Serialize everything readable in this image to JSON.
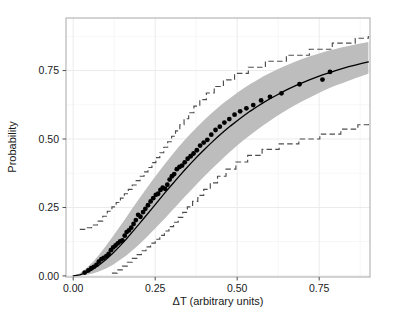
{
  "chart_data": {
    "type": "line",
    "title": "",
    "subtitle": "",
    "xlabel": "ΔT (arbitrary units)",
    "ylabel": "Probability",
    "xlim": [
      -0.022,
      0.905
    ],
    "ylim": [
      -0.004,
      0.942
    ],
    "xticks": [
      0.0,
      0.25,
      0.5,
      0.75
    ],
    "xtick_labels": [
      "0.00",
      "0.25",
      "0.50",
      "0.75"
    ],
    "yticks": [
      0.0,
      0.25,
      0.5,
      0.75
    ],
    "ytick_labels": [
      "0.00",
      "0.25",
      "0.50",
      "0.75"
    ],
    "x_minor_ticks": [
      0.125,
      0.375,
      0.625,
      0.875
    ],
    "y_minor_ticks": [
      0.125,
      0.375,
      0.625,
      0.875
    ],
    "grid": true,
    "grid_color": "#ebebeb",
    "minor_grid_color": "#f4f4f4",
    "legend": null,
    "legend_position": "none",
    "panel_border_color": "#a8a8a8",
    "panel_background": "#ffffff",
    "series": [
      {
        "name": "fitted probability curve",
        "type": "line",
        "style": "solid",
        "color": "#000000",
        "linewidth": 1.3,
        "x": [
          0.0,
          0.02,
          0.04,
          0.06,
          0.08,
          0.1,
          0.12,
          0.14,
          0.16,
          0.18,
          0.2,
          0.22,
          0.24,
          0.26,
          0.28,
          0.3,
          0.32,
          0.34,
          0.36,
          0.38,
          0.4,
          0.42,
          0.44,
          0.46,
          0.48,
          0.5,
          0.52,
          0.54,
          0.56,
          0.58,
          0.6,
          0.62,
          0.64,
          0.66,
          0.68,
          0.7,
          0.72,
          0.74,
          0.76,
          0.78,
          0.8,
          0.82,
          0.84,
          0.86,
          0.88,
          0.9
        ],
        "y": [
          0.0,
          0.004,
          0.012,
          0.024,
          0.041,
          0.06,
          0.082,
          0.106,
          0.132,
          0.16,
          0.188,
          0.217,
          0.246,
          0.275,
          0.304,
          0.332,
          0.36,
          0.387,
          0.413,
          0.438,
          0.462,
          0.485,
          0.507,
          0.528,
          0.548,
          0.567,
          0.585,
          0.602,
          0.618,
          0.633,
          0.647,
          0.66,
          0.673,
          0.685,
          0.696,
          0.706,
          0.716,
          0.725,
          0.734,
          0.742,
          0.75,
          0.757,
          0.764,
          0.77,
          0.776,
          0.782
        ]
      },
      {
        "name": "confidence band upper bound",
        "type": "band-edge",
        "color": "#bdbdbd",
        "x": [
          0.0,
          0.02,
          0.04,
          0.06,
          0.08,
          0.1,
          0.12,
          0.14,
          0.16,
          0.18,
          0.2,
          0.22,
          0.24,
          0.26,
          0.28,
          0.3,
          0.32,
          0.34,
          0.36,
          0.38,
          0.4,
          0.42,
          0.44,
          0.46,
          0.48,
          0.5,
          0.52,
          0.54,
          0.56,
          0.58,
          0.6,
          0.62,
          0.64,
          0.66,
          0.68,
          0.7,
          0.72,
          0.74,
          0.76,
          0.78,
          0.8,
          0.82,
          0.84,
          0.86,
          0.88,
          0.9
        ],
        "y": [
          0.0,
          0.01,
          0.028,
          0.051,
          0.079,
          0.11,
          0.143,
          0.177,
          0.211,
          0.246,
          0.28,
          0.314,
          0.347,
          0.379,
          0.41,
          0.44,
          0.469,
          0.496,
          0.522,
          0.547,
          0.57,
          0.592,
          0.613,
          0.633,
          0.651,
          0.669,
          0.685,
          0.701,
          0.715,
          0.729,
          0.741,
          0.753,
          0.764,
          0.774,
          0.784,
          0.793,
          0.801,
          0.809,
          0.816,
          0.823,
          0.829,
          0.835,
          0.84,
          0.845,
          0.85,
          0.854
        ]
      },
      {
        "name": "confidence band lower bound",
        "type": "band-edge",
        "color": "#bdbdbd",
        "x": [
          0.0,
          0.02,
          0.04,
          0.06,
          0.08,
          0.1,
          0.12,
          0.14,
          0.16,
          0.18,
          0.2,
          0.22,
          0.24,
          0.26,
          0.28,
          0.3,
          0.32,
          0.34,
          0.36,
          0.38,
          0.4,
          0.42,
          0.44,
          0.46,
          0.48,
          0.5,
          0.52,
          0.54,
          0.56,
          0.58,
          0.6,
          0.62,
          0.64,
          0.66,
          0.68,
          0.7,
          0.72,
          0.74,
          0.76,
          0.78,
          0.8,
          0.82,
          0.84,
          0.86,
          0.88,
          0.9
        ],
        "y": [
          0.0,
          0.001,
          0.004,
          0.009,
          0.017,
          0.027,
          0.04,
          0.056,
          0.073,
          0.093,
          0.114,
          0.137,
          0.161,
          0.186,
          0.211,
          0.237,
          0.263,
          0.289,
          0.314,
          0.339,
          0.364,
          0.388,
          0.411,
          0.433,
          0.455,
          0.476,
          0.496,
          0.515,
          0.533,
          0.55,
          0.567,
          0.583,
          0.598,
          0.612,
          0.626,
          0.639,
          0.651,
          0.663,
          0.674,
          0.685,
          0.695,
          0.704,
          0.713,
          0.722,
          0.73,
          0.738
        ]
      },
      {
        "name": "observed data points",
        "type": "scatter",
        "marker": "circle",
        "color": "#000000",
        "marker_size": 2.4,
        "x": [
          0.035,
          0.046,
          0.055,
          0.063,
          0.071,
          0.078,
          0.086,
          0.093,
          0.101,
          0.108,
          0.115,
          0.122,
          0.129,
          0.136,
          0.143,
          0.15,
          0.157,
          0.163,
          0.17,
          0.177,
          0.184,
          0.191,
          0.198,
          0.205,
          0.213,
          0.22,
          0.228,
          0.236,
          0.244,
          0.252,
          0.259,
          0.266,
          0.273,
          0.28,
          0.287,
          0.294,
          0.301,
          0.308,
          0.316,
          0.324,
          0.332,
          0.34,
          0.349,
          0.358,
          0.367,
          0.377,
          0.387,
          0.398,
          0.409,
          0.421,
          0.434,
          0.447,
          0.461,
          0.476,
          0.492,
          0.509,
          0.528,
          0.549,
          0.573,
          0.6,
          0.635,
          0.69,
          0.76,
          0.783
        ],
        "y": [
          0.012,
          0.02,
          0.028,
          0.033,
          0.04,
          0.052,
          0.061,
          0.066,
          0.072,
          0.08,
          0.094,
          0.104,
          0.111,
          0.119,
          0.126,
          0.13,
          0.147,
          0.16,
          0.166,
          0.176,
          0.19,
          0.204,
          0.223,
          0.216,
          0.233,
          0.245,
          0.258,
          0.272,
          0.284,
          0.296,
          0.3,
          0.314,
          0.322,
          0.318,
          0.333,
          0.352,
          0.364,
          0.372,
          0.39,
          0.398,
          0.403,
          0.415,
          0.428,
          0.437,
          0.447,
          0.459,
          0.476,
          0.487,
          0.497,
          0.516,
          0.533,
          0.545,
          0.56,
          0.573,
          0.589,
          0.601,
          0.612,
          0.624,
          0.641,
          0.654,
          0.667,
          0.7,
          0.717,
          0.745
        ]
      },
      {
        "name": "upper step envelope",
        "type": "step",
        "style": "dashed",
        "color": "#4d4d4d",
        "x": [
          0.02,
          0.038,
          0.056,
          0.074,
          0.09,
          0.104,
          0.118,
          0.131,
          0.144,
          0.156,
          0.168,
          0.18,
          0.192,
          0.204,
          0.216,
          0.228,
          0.24,
          0.252,
          0.264,
          0.276,
          0.288,
          0.3,
          0.312,
          0.325,
          0.338,
          0.352,
          0.368,
          0.386,
          0.406,
          0.43,
          0.458,
          0.492,
          0.534,
          0.586,
          0.65,
          0.72,
          0.79,
          0.86,
          0.9
        ],
        "y": [
          0.17,
          0.176,
          0.186,
          0.2,
          0.218,
          0.236,
          0.252,
          0.268,
          0.284,
          0.3,
          0.316,
          0.332,
          0.348,
          0.364,
          0.38,
          0.396,
          0.414,
          0.432,
          0.45,
          0.47,
          0.49,
          0.51,
          0.53,
          0.552,
          0.574,
          0.596,
          0.62,
          0.644,
          0.668,
          0.692,
          0.716,
          0.74,
          0.762,
          0.784,
          0.806,
          0.828,
          0.85,
          0.868,
          0.876
        ]
      },
      {
        "name": "lower step envelope",
        "type": "step",
        "style": "dashed",
        "color": "#4d4d4d",
        "x": [
          0.118,
          0.134,
          0.15,
          0.165,
          0.18,
          0.194,
          0.208,
          0.222,
          0.236,
          0.25,
          0.264,
          0.278,
          0.292,
          0.306,
          0.32,
          0.334,
          0.348,
          0.364,
          0.38,
          0.398,
          0.418,
          0.44,
          0.466,
          0.496,
          0.532,
          0.576,
          0.628,
          0.688,
          0.752,
          0.816,
          0.868,
          0.9
        ],
        "y": [
          0.01,
          0.022,
          0.036,
          0.05,
          0.064,
          0.078,
          0.092,
          0.106,
          0.12,
          0.134,
          0.148,
          0.164,
          0.18,
          0.196,
          0.214,
          0.232,
          0.252,
          0.272,
          0.294,
          0.316,
          0.34,
          0.364,
          0.39,
          0.416,
          0.44,
          0.462,
          0.482,
          0.5,
          0.518,
          0.536,
          0.552,
          0.562
        ]
      }
    ],
    "annotations": []
  },
  "axes": {
    "x_title": "ΔT (arbitrary units)",
    "y_title": "Probability"
  }
}
